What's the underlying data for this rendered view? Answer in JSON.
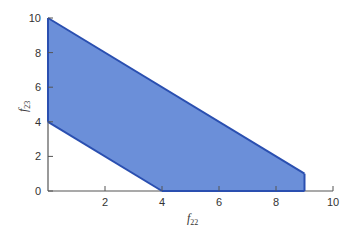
{
  "chart_data": {
    "type": "area",
    "title": "",
    "xlabel": "f22",
    "ylabel": "f23",
    "xlabel_parts": {
      "base": "f",
      "sub": "22"
    },
    "ylabel_parts": {
      "base": "f",
      "sub": "23"
    },
    "xlim": [
      0,
      10
    ],
    "ylim": [
      0,
      10
    ],
    "xticks": [
      2,
      4,
      6,
      8,
      10
    ],
    "yticks": [
      0,
      2,
      4,
      6,
      8,
      10
    ],
    "grid": false,
    "legend": null,
    "series": [
      {
        "name": "feasible region",
        "polygon": [
          [
            0,
            10
          ],
          [
            9,
            1
          ],
          [
            9,
            0
          ],
          [
            4,
            0
          ],
          [
            0,
            4
          ]
        ],
        "fill_color": "#6b8fd9",
        "edge_color": "#2a4fb0"
      }
    ]
  },
  "colors": {
    "axis": "#555555",
    "fill": "#6b8fd9",
    "edge": "#2a4fb0"
  }
}
